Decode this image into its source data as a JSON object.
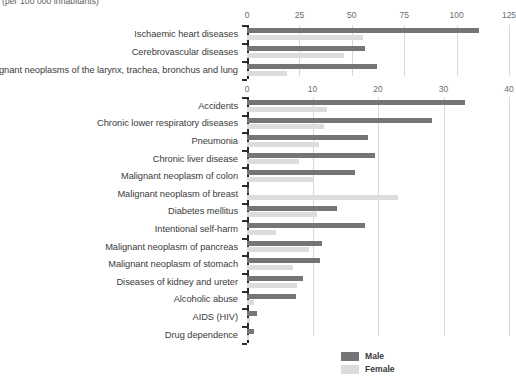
{
  "subtitle": "(per 100 000 inhabitants)",
  "colors": {
    "male": "#757578",
    "female": "#dcdcdc",
    "grid": "#d8d8d8",
    "axis": "#2b2b2b",
    "text": "#3b3b3b"
  },
  "legend": {
    "position": "bottom-center",
    "items": [
      {
        "label": "Male",
        "color": "#757578",
        "swatch_name": "legend-swatch-male"
      },
      {
        "label": "Female",
        "color": "#dcdcdc",
        "swatch_name": "legend-swatch-female"
      }
    ]
  },
  "chart_data": [
    {
      "type": "bar",
      "orientation": "horizontal",
      "title": "",
      "subtitle": "(per 100 000 inhabitants)",
      "xlabel": "",
      "ylabel": "",
      "xlim": [
        0,
        125
      ],
      "xticks": [
        0,
        25,
        50,
        75,
        100,
        125
      ],
      "grid": true,
      "legend": "bottom",
      "categories": [
        "Ischaemic heart diseases",
        "Cerebrovascular diseases",
        "Malignant neoplasms of the larynx, trachea, bronchus and lung"
      ],
      "series": [
        {
          "name": "Male",
          "color": "#757578",
          "values": [
            110.5,
            56.5,
            62.0
          ]
        },
        {
          "name": "Female",
          "color": "#dcdcdc",
          "values": [
            55.5,
            46.5,
            19.0
          ]
        }
      ]
    },
    {
      "type": "bar",
      "orientation": "horizontal",
      "title": "",
      "xlabel": "",
      "ylabel": "",
      "xlim": [
        0,
        40
      ],
      "xticks": [
        0,
        10,
        20,
        30,
        40
      ],
      "grid": true,
      "legend": "bottom",
      "categories": [
        "Accidents",
        "Chronic lower respiratory diseases",
        "Pneumonia",
        "Chronic liver disease",
        "Malignant neoplasm of colon",
        "Malignant neoplasm of breast",
        "Diabetes mellitus",
        "Intentional self-harm",
        "Malignant neoplasm of pancreas",
        "Malignant neoplasm of stomach",
        "Diseases of kidney and ureter",
        "Alcoholic abuse",
        "AIDS (HIV)",
        "Drug dependence"
      ],
      "series": [
        {
          "name": "Male",
          "color": "#757578",
          "values": [
            33.3,
            28.3,
            18.4,
            19.5,
            16.5,
            0.3,
            13.8,
            18.0,
            11.5,
            11.2,
            8.5,
            7.5,
            1.5,
            1.0
          ]
        },
        {
          "name": "Female",
          "color": "#dcdcdc",
          "values": [
            12.2,
            11.7,
            11.0,
            8.0,
            10.2,
            23.0,
            10.7,
            4.5,
            9.5,
            7.0,
            7.6,
            1.0,
            0.4,
            0.3
          ]
        }
      ]
    }
  ]
}
